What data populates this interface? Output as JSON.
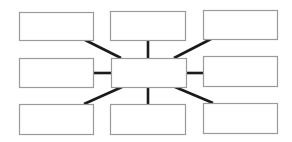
{
  "diagram": {
    "type": "spider-map",
    "center": {
      "label": "",
      "x": 111,
      "y": 58,
      "w": 75,
      "h": 29
    },
    "nodes": [
      {
        "id": "top-left",
        "label": "",
        "x": 19,
        "y": 12,
        "w": 74,
        "h": 28
      },
      {
        "id": "top-center",
        "label": "",
        "x": 110,
        "y": 11,
        "w": 75,
        "h": 29
      },
      {
        "id": "top-right",
        "label": "",
        "x": 203,
        "y": 10,
        "w": 74,
        "h": 29
      },
      {
        "id": "middle-left",
        "label": "",
        "x": 19,
        "y": 58,
        "w": 74,
        "h": 29
      },
      {
        "id": "middle-right",
        "label": "",
        "x": 203,
        "y": 56,
        "w": 74,
        "h": 30
      },
      {
        "id": "bottom-left",
        "label": "",
        "x": 19,
        "y": 104,
        "w": 74,
        "h": 30
      },
      {
        "id": "bottom-center",
        "label": "",
        "x": 110,
        "y": 104,
        "w": 75,
        "h": 30
      },
      {
        "id": "bottom-right",
        "label": "",
        "x": 203,
        "y": 103,
        "w": 74,
        "h": 30
      }
    ],
    "connectors": [
      {
        "to": "top-left",
        "x1": 121,
        "y1": 58,
        "x2": 85,
        "y2": 40
      },
      {
        "to": "top-center",
        "x1": 148,
        "y1": 58,
        "x2": 148,
        "y2": 40
      },
      {
        "to": "top-right",
        "x1": 174,
        "y1": 58,
        "x2": 211,
        "y2": 39
      },
      {
        "to": "middle-left",
        "x1": 111,
        "y1": 73,
        "x2": 93,
        "y2": 73
      },
      {
        "to": "middle-right",
        "x1": 186,
        "y1": 73,
        "x2": 203,
        "y2": 73
      },
      {
        "to": "bottom-left",
        "x1": 122,
        "y1": 87,
        "x2": 84,
        "y2": 104
      },
      {
        "to": "bottom-center",
        "x1": 148,
        "y1": 87,
        "x2": 148,
        "y2": 104
      },
      {
        "to": "bottom-right",
        "x1": 175,
        "y1": 87,
        "x2": 213,
        "y2": 103
      }
    ],
    "colors": {
      "box_stroke": "#9a9a9a",
      "connector": "#1a1a1a",
      "background": "#ffffff"
    }
  }
}
